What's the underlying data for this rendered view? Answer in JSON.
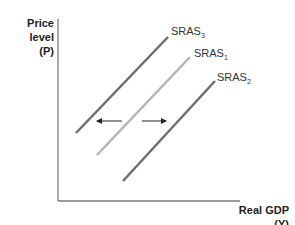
{
  "diagram": {
    "type": "economics-graph",
    "y_axis": {
      "label": "Price level",
      "symbol": "(P)"
    },
    "x_axis": {
      "label": "Real GDP",
      "symbol": "(Y)"
    },
    "curves": [
      {
        "id": "sras3",
        "label": "SRAS",
        "subscript": "3",
        "color": "#6e6e6e",
        "x1": 76,
        "y1": 133,
        "x2": 168,
        "y2": 37
      },
      {
        "id": "sras1",
        "label": "SRAS",
        "subscript": "1",
        "color": "#b4b4b4",
        "x1": 97,
        "y1": 155,
        "x2": 190,
        "y2": 57
      },
      {
        "id": "sras2",
        "label": "SRAS",
        "subscript": "2",
        "color": "#6e6e6e",
        "x1": 123,
        "y1": 181,
        "x2": 215,
        "y2": 81
      }
    ],
    "arrows": [
      {
        "id": "shift-left",
        "direction": "left"
      },
      {
        "id": "shift-right",
        "direction": "right"
      }
    ]
  }
}
